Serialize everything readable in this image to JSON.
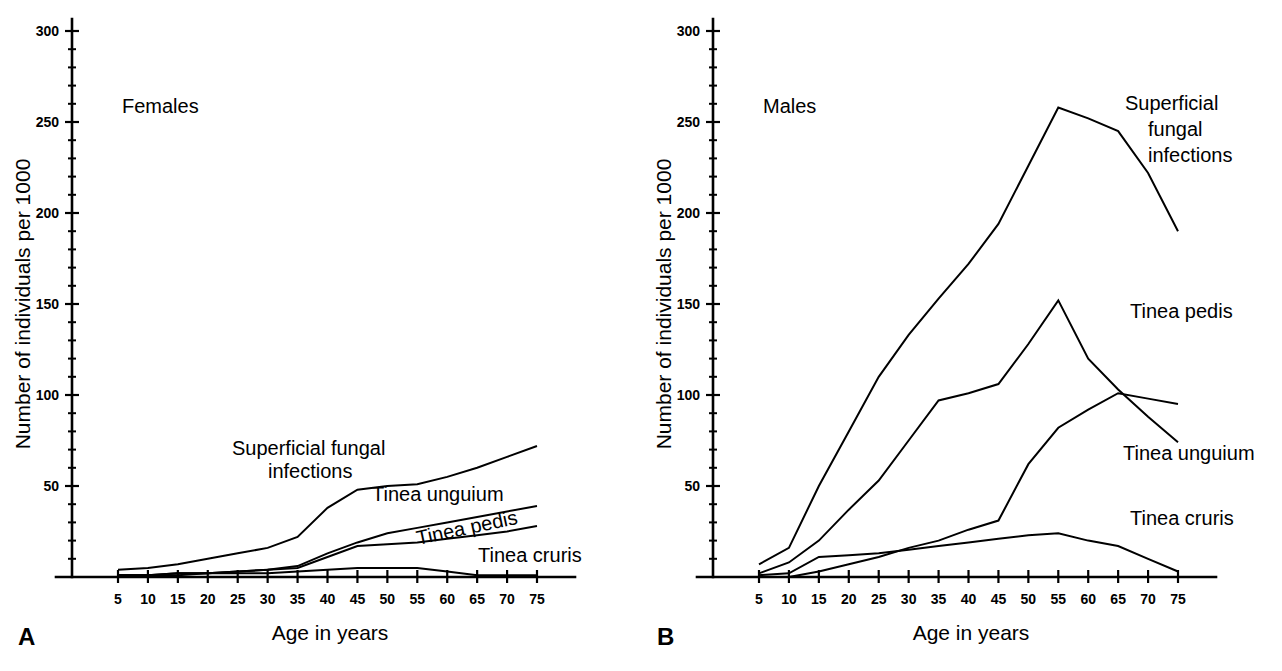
{
  "figure": {
    "background": "#ffffff",
    "line_color": "#000000",
    "panels": [
      {
        "letter": "A",
        "group_title": "Females",
        "xlabel": "Age in years",
        "ylabel": "Number of individuals per 1000",
        "yticks": [
          0,
          50,
          100,
          150,
          200,
          250,
          300
        ],
        "ytick_labels": [
          "",
          "50",
          "100",
          "150",
          "200",
          "250",
          "300"
        ],
        "xticks": [
          5,
          10,
          15,
          20,
          25,
          30,
          35,
          40,
          45,
          50,
          55,
          60,
          65,
          70,
          75
        ],
        "xtick_labels": [
          "5",
          "10",
          "15",
          "20",
          "25",
          "30",
          "35",
          "40",
          "45",
          "50",
          "55",
          "60",
          "65",
          "70",
          "75"
        ],
        "series_labels": [
          {
            "text": "Superficial fungal",
            "x": 232,
            "y": 455
          },
          {
            "text": "infections",
            "x": 268,
            "y": 478
          },
          {
            "text": "Tinea unguium",
            "x": 372,
            "y": 501
          },
          {
            "text": "Tinea pedis",
            "x": 418,
            "y": 545,
            "rotate": -12
          },
          {
            "text": "Tinea cruris",
            "x": 478,
            "y": 562
          }
        ]
      },
      {
        "letter": "B",
        "group_title": "Males",
        "xlabel": "Age in years",
        "ylabel": "Number of individuals per 1000",
        "yticks": [
          0,
          50,
          100,
          150,
          200,
          250,
          300
        ],
        "ytick_labels": [
          "",
          "50",
          "100",
          "150",
          "200",
          "250",
          "300"
        ],
        "xticks": [
          5,
          10,
          15,
          20,
          25,
          30,
          35,
          40,
          45,
          50,
          55,
          60,
          65,
          70,
          75
        ],
        "xtick_labels": [
          "5",
          "10",
          "15",
          "20",
          "25",
          "30",
          "35",
          "40",
          "45",
          "50",
          "55",
          "60",
          "65",
          "70",
          "75"
        ],
        "series_labels": [
          {
            "text": "Superficial",
            "x": 1125,
            "y": 110
          },
          {
            "text": "fungal",
            "x": 1148,
            "y": 136
          },
          {
            "text": "infections",
            "x": 1148,
            "y": 162
          },
          {
            "text": "Tinea pedis",
            "x": 1130,
            "y": 318
          },
          {
            "text": "Tinea unguium",
            "x": 1123,
            "y": 460
          },
          {
            "text": "Tinea cruris",
            "x": 1130,
            "y": 525
          }
        ]
      }
    ]
  },
  "chart_data": [
    {
      "type": "line",
      "title": "Females",
      "panel": "A",
      "xlabel": "Age in years",
      "ylabel": "Number of individuals per 1000",
      "xlim": [
        0,
        78
      ],
      "ylim": [
        0,
        300
      ],
      "grid": false,
      "legend": "inline-annotations",
      "x": [
        5,
        10,
        15,
        20,
        25,
        30,
        35,
        40,
        45,
        50,
        55,
        60,
        65,
        70,
        75
      ],
      "series": [
        {
          "name": "Superficial fungal infections",
          "values": [
            4,
            5,
            7,
            10,
            13,
            16,
            22,
            38,
            48,
            50,
            51,
            55,
            60,
            66,
            72
          ]
        },
        {
          "name": "Tinea unguium",
          "values": [
            1,
            1,
            2,
            2,
            3,
            4,
            6,
            13,
            19,
            24,
            27,
            30,
            33,
            36,
            39
          ]
        },
        {
          "name": "Tinea pedis",
          "values": [
            1,
            1,
            2,
            2,
            3,
            4,
            5,
            11,
            17,
            18,
            19,
            21,
            23,
            25,
            28
          ]
        },
        {
          "name": "Tinea cruris",
          "values": [
            1,
            1,
            1,
            2,
            2,
            2,
            3,
            4,
            5,
            5,
            5,
            3,
            1,
            1,
            1
          ]
        }
      ]
    },
    {
      "type": "line",
      "title": "Males",
      "panel": "B",
      "xlabel": "Age in years",
      "ylabel": "Number of individuals per 1000",
      "xlim": [
        0,
        78
      ],
      "ylim": [
        0,
        300
      ],
      "grid": false,
      "legend": "inline-annotations",
      "x": [
        5,
        10,
        15,
        20,
        25,
        30,
        35,
        40,
        45,
        50,
        55,
        60,
        65,
        70,
        75
      ],
      "series": [
        {
          "name": "Superficial fungal infections",
          "values": [
            7,
            16,
            50,
            80,
            110,
            133,
            153,
            172,
            194,
            226,
            258,
            252,
            245,
            222,
            190
          ]
        },
        {
          "name": "Tinea pedis",
          "values": [
            2,
            8,
            20,
            37,
            53,
            75,
            97,
            101,
            106,
            128,
            152,
            120,
            103,
            88,
            74
          ]
        },
        {
          "name": "Tinea unguium",
          "values": [
            0,
            0,
            3,
            7,
            11,
            16,
            20,
            26,
            31,
            62,
            82,
            92,
            101,
            98,
            95
          ]
        },
        {
          "name": "Tinea cruris",
          "values": [
            1,
            2,
            11,
            12,
            13,
            15,
            17,
            19,
            21,
            23,
            24,
            20,
            17,
            10,
            3
          ]
        }
      ]
    }
  ]
}
